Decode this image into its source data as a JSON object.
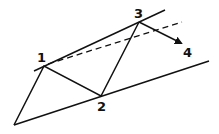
{
  "diagram": {
    "stroke_color": "#111111",
    "background": "#ffffff",
    "labels": {
      "p1": "1",
      "p2": "2",
      "p3": "3",
      "p4": "4"
    },
    "points": {
      "start": [
        14,
        125
      ],
      "p1": [
        44,
        66
      ],
      "p2": [
        101,
        96
      ],
      "p3": [
        139,
        22
      ],
      "p4_arrow_tip": [
        183,
        44
      ]
    },
    "lines": {
      "upper_trend": {
        "from": [
          34,
          71
        ],
        "to": [
          165,
          10
        ],
        "style": "solid"
      },
      "lower_trend": {
        "from": [
          14,
          125
        ],
        "to": [
          209,
          61
        ],
        "style": "solid"
      },
      "dashed_projection": {
        "from": [
          48,
          64
        ],
        "to": [
          182,
          22
        ],
        "style": "dashed"
      }
    }
  }
}
